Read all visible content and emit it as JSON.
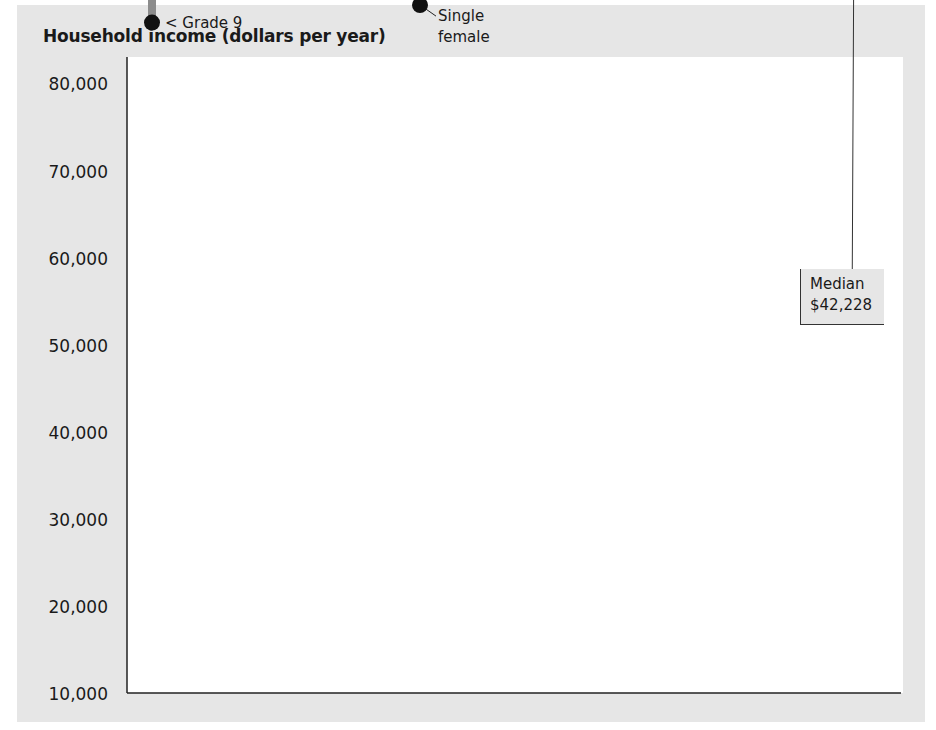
{
  "title": "Household income (dollars per year)",
  "median": {
    "label": "Median",
    "value_label": "$42,228",
    "value": 42228
  },
  "colors": {
    "panel": "#e6e6e6",
    "plot_bg": "#ffffff",
    "bar_dark": "#8c8c8c",
    "bar_light": "#c4c4c4",
    "dot": "#111111",
    "median_line": "#8c8c8c"
  },
  "yaxis": {
    "ticks": [
      "80,000",
      "70,000",
      "60,000",
      "50,000",
      "40,000",
      "30,000",
      "20,000",
      "10,000"
    ]
  },
  "chart_data": {
    "type": "scatter",
    "title": "Household income (dollars per year)",
    "xlabel": "",
    "ylabel": "Household income (dollars per year)",
    "ylim": [
      10000,
      80000
    ],
    "yticks": [
      10000,
      20000,
      30000,
      40000,
      50000,
      60000,
      70000,
      80000
    ],
    "grid": false,
    "reference_line": {
      "label": "Median $42,228",
      "value": 42228
    },
    "series": [
      {
        "name": "Education",
        "points": [
          {
            "label": "Bachelor's degree or higher",
            "value": 72000
          },
          {
            "label": "Assoc. degree",
            "value": 51000
          },
          {
            "label": "Some college",
            "value": 45600
          },
          {
            "label": "High school",
            "value": 36900
          },
          {
            "label": "Grade 9–12",
            "value": 22600
          },
          {
            "label": "< Grade 9",
            "value": 17700
          }
        ]
      },
      {
        "name": "Household size",
        "points": [
          {
            "label": "4 persons",
            "value": 61800
          },
          {
            "label": "5 persons",
            "value": 56200
          },
          {
            "label": "7+ persons",
            "value": 53900
          },
          {
            "label": "6 persons",
            "value": 53000
          },
          {
            "label": "3 persons",
            "value": 52500
          },
          {
            "label": "2 persons",
            "value": 44700
          },
          {
            "label": "1 person",
            "value": 21800
          }
        ]
      },
      {
        "name": "Household type",
        "points": [
          {
            "label": "Married couple",
            "value": 58900
          },
          {
            "label": "Male, wife absent",
            "value": 43200
          },
          {
            "label": "Single male",
            "value": 28000
          },
          {
            "label": "Female, husband absent",
            "value": 27000
          },
          {
            "label": "Single female",
            "value": 17900
          }
        ]
      },
      {
        "name": "Age",
        "points": [
          {
            "label": "45–54",
            "value": 59000
          },
          {
            "label": "35–44",
            "value": 52800
          },
          {
            "label": "55–64",
            "value": 46400
          },
          {
            "label": "25–34",
            "value": 43800
          },
          {
            "label": "15–24",
            "value": 26300
          },
          {
            "label": "65 and over",
            "value": 23600
          }
        ]
      },
      {
        "name": "Race",
        "points": [
          {
            "label": "White",
            "value": 44100
          },
          {
            "label": "Hispanic",
            "value": 32200
          },
          {
            "label": "Black",
            "value": 29100
          }
        ]
      },
      {
        "name": "Region",
        "points": [
          {
            "label": "West",
            "value": 44500
          },
          {
            "label": "Midwest",
            "value": 43900
          },
          {
            "label": "Northeast",
            "value": 43400
          },
          {
            "label": "South",
            "value": 39000
          }
        ]
      }
    ]
  }
}
